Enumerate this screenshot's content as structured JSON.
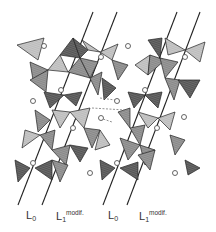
{
  "figure": {
    "type": "crystal-structure-polyhedral-diagram",
    "colors": {
      "dark_tetra": "#5a5a5a",
      "mid_tetra": "#8c8c8c",
      "light_tetra": "#bdbdbd",
      "edge": "#222222",
      "circle": "#555555",
      "dashed": "#777777"
    },
    "labels": [
      {
        "id": "L0_a",
        "main": "L",
        "sub": "0",
        "sup": ""
      },
      {
        "id": "L1_a",
        "main": "L",
        "sub": "1",
        "sup": "modif."
      },
      {
        "id": "L0_b",
        "main": "L",
        "sub": "0",
        "sup": ""
      },
      {
        "id": "L1_b",
        "main": "L",
        "sub": "1",
        "sup": "modif."
      }
    ]
  }
}
